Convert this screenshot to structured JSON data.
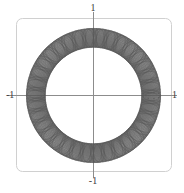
{
  "figure": {
    "frame": {
      "stroke": "#d0d0d0",
      "corner_radius": 6,
      "x": 16,
      "y": 18,
      "width": 156,
      "height": 154
    },
    "axes": {
      "stroke": "#8c8c8c",
      "origin_x": 93,
      "origin_y": 95
    },
    "curve": {
      "stroke": "#5a5a5a",
      "stroke_width": 0.45
    }
  },
  "labels": {
    "top": "1",
    "bottom": "-1",
    "left": "-1",
    "right": "1"
  },
  "chart_data": {
    "type": "line",
    "title": "",
    "subtitle": "",
    "xlabel": "",
    "ylabel": "",
    "xlim": [
      -1.3,
      1.3
    ],
    "ylim": [
      -1.3,
      1.3
    ],
    "grid": false,
    "legend": null,
    "x_ticks": [
      -1,
      1
    ],
    "x_tick_labels": [
      "-1",
      "1"
    ],
    "y_ticks": [
      -1,
      1
    ],
    "y_tick_labels": [
      "-1",
      "1"
    ],
    "annotations": [],
    "series": [
      {
        "name": "braid-strand-forward",
        "kind": "parametric",
        "direction": 1,
        "parametric": {
          "R": 0.86,
          "r": 0.14,
          "petals": 34,
          "turns": 1,
          "t_start": 0,
          "t_end": 6.283185307179586,
          "samples": 3600,
          "x": "(R + r*cos(petals*t)) * cos(t)",
          "y": "(R + r*cos(petals*t)) * sin(t)",
          "phase": 0
        }
      },
      {
        "name": "braid-strand-reverse",
        "kind": "parametric",
        "direction": -1,
        "parametric": {
          "R": 0.86,
          "r": 0.14,
          "petals": 34,
          "turns": 1,
          "t_start": 0,
          "t_end": 6.283185307179586,
          "samples": 3600,
          "x": "(R + r*cos(petals*t + pi)) * cos(t)",
          "y": "(R + r*cos(petals*t + pi)) * sin(t)",
          "phase": 3.141592653589793
        }
      },
      {
        "name": "braid-strand-forward-offset",
        "kind": "parametric",
        "direction": 1,
        "parametric": {
          "R": 0.86,
          "r": 0.14,
          "petals": 34,
          "turns": 1,
          "t_start": 0,
          "t_end": 6.283185307179586,
          "samples": 3600,
          "x": "(R + r*cos(petals*t + pi/2)) * cos(t)",
          "y": "(R + r*cos(petals*t + pi/2)) * sin(t)",
          "phase": 1.5707963267948966
        }
      },
      {
        "name": "braid-strand-reverse-offset",
        "kind": "parametric",
        "direction": -1,
        "parametric": {
          "R": 0.86,
          "r": 0.14,
          "petals": 34,
          "turns": 1,
          "t_start": 0,
          "t_end": 6.283185307179586,
          "samples": 3600,
          "x": "(R + r*cos(petals*t + 3*pi/2)) * cos(t)",
          "y": "(R + r*cos(petals*t + 3*pi/2)) * sin(t)",
          "phase": 4.71238898038469
        }
      }
    ]
  }
}
